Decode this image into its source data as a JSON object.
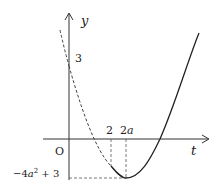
{
  "diagram": {
    "type": "function-graph",
    "axes": {
      "x_label": "t",
      "y_label": "y",
      "origin_label": "O"
    },
    "labels": {
      "y_intercept": "3",
      "tick_2": "2",
      "tick_2a_num": "2",
      "tick_2a_var": "a",
      "min_value_prefix": "−4",
      "min_value_var": "a",
      "min_value_exp": "2",
      "min_value_suffix": " + 3"
    },
    "key_points": {
      "y_intercept": {
        "t": 0,
        "y": 3
      },
      "reference_t": 2,
      "vertex": {
        "t": "2a",
        "y": "-4a^2 + 3"
      }
    },
    "colors": {
      "curve": "#222222",
      "axes": "#333333",
      "dashed": "#555555"
    }
  }
}
